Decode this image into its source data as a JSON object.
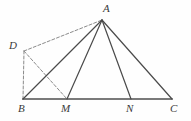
{
  "figure": {
    "canvas": {
      "width": 191,
      "height": 121
    },
    "background_color": "#fefefe",
    "stroke_color": "#4a4a4a",
    "baseline_color": "#7a7a7a",
    "dash_color": "#8a8a8a",
    "label_color": "#3a3a3a",
    "points": [
      {
        "id": "A",
        "label": "A",
        "x": 102,
        "y": 20,
        "label_x": 103,
        "label_y": 3,
        "label_anchor": "left"
      },
      {
        "id": "B",
        "label": "B",
        "x": 23,
        "y": 99,
        "label_x": 18,
        "label_y": 103,
        "label_anchor": "left"
      },
      {
        "id": "M",
        "label": "M",
        "x": 67,
        "y": 99,
        "label_x": 61,
        "label_y": 103,
        "label_anchor": "left"
      },
      {
        "id": "N",
        "label": "N",
        "x": 131,
        "y": 99,
        "label_x": 126,
        "label_y": 103,
        "label_anchor": "left"
      },
      {
        "id": "C",
        "label": "C",
        "x": 172,
        "y": 99,
        "label_x": 170,
        "label_y": 103,
        "label_anchor": "left"
      },
      {
        "id": "D",
        "label": "D",
        "x": 24,
        "y": 51,
        "label_x": 9,
        "label_y": 40,
        "label_anchor": "left"
      }
    ],
    "solid_segments": [
      {
        "name": "segment-BC-baseline",
        "from": "B",
        "to": "C",
        "width": 2.0,
        "color": "#7a7a7a"
      },
      {
        "name": "segment-AB",
        "from": "A",
        "to": "B",
        "width": 1.2,
        "color": "#4a4a4a"
      },
      {
        "name": "segment-AM",
        "from": "A",
        "to": "M",
        "width": 1.2,
        "color": "#4a4a4a"
      },
      {
        "name": "segment-AN",
        "from": "A",
        "to": "N",
        "width": 1.2,
        "color": "#4a4a4a"
      },
      {
        "name": "segment-AC",
        "from": "A",
        "to": "C",
        "width": 1.2,
        "color": "#4a4a4a"
      }
    ],
    "dashed_segments": [
      {
        "name": "segment-DA",
        "from": "D",
        "to": "A",
        "width": 1.0,
        "color": "#8a8a8a",
        "dash": "3,2"
      },
      {
        "name": "segment-DB",
        "from": "D",
        "to": "B",
        "width": 1.0,
        "color": "#8a8a8a",
        "dash": "3,2"
      },
      {
        "name": "segment-DM",
        "from": "D",
        "to": "M",
        "width": 1.0,
        "color": "#8a8a8a",
        "dash": "3,2"
      }
    ]
  }
}
